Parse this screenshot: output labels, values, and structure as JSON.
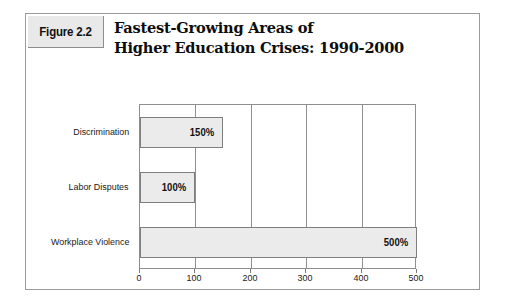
{
  "figure": {
    "number_label": "Figure 2.2",
    "title_line1": "Fastest-Growing Areas of",
    "title_line2": "Higher Education Crises: 1990-2000"
  },
  "colors": {
    "frame_border": "#9b9b9b",
    "label_box_fill": "#e9e9e9",
    "bar_fill": "#ebebeb",
    "bar_border": "#7e7e7e",
    "plot_border": "#8f8f8f",
    "text": "#111111",
    "page_background": "#ffffff"
  },
  "chart_data": {
    "type": "bar",
    "orientation": "horizontal",
    "title": "Fastest-Growing Areas of Higher Education Crises: 1990-2000",
    "xlabel": "",
    "ylabel": "",
    "categories": [
      "Discrimination",
      "Labor Disputes",
      "Workplace Violence"
    ],
    "values": [
      150,
      100,
      500
    ],
    "value_labels": [
      "150%",
      "100%",
      "500%"
    ],
    "xlim": [
      0,
      500
    ],
    "xticks": [
      0,
      100,
      200,
      300,
      400,
      500
    ],
    "xtick_labels": [
      "0",
      "100",
      "200",
      "300",
      "400",
      "500"
    ],
    "grid": true,
    "grid_axis": "x",
    "legend": false,
    "series": [
      {
        "name": "Growth",
        "values": [
          150,
          100,
          500
        ]
      }
    ]
  }
}
